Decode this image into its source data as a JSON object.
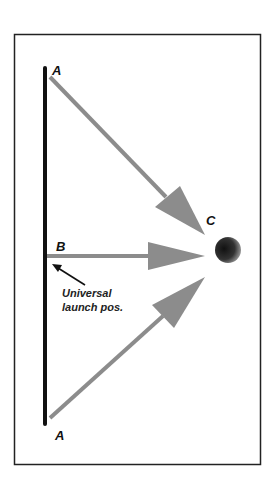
{
  "diagram": {
    "labels": {
      "top_start": "A",
      "middle_start": "B",
      "bottom_start": "A",
      "target": "C"
    },
    "annotation": {
      "line1": "Universal",
      "line2": "launch pos."
    },
    "colors": {
      "frame": "#222222",
      "launch_bar": "#111111",
      "arrows": "#8c8c8c",
      "target_ball": "#1a1a1a"
    }
  }
}
